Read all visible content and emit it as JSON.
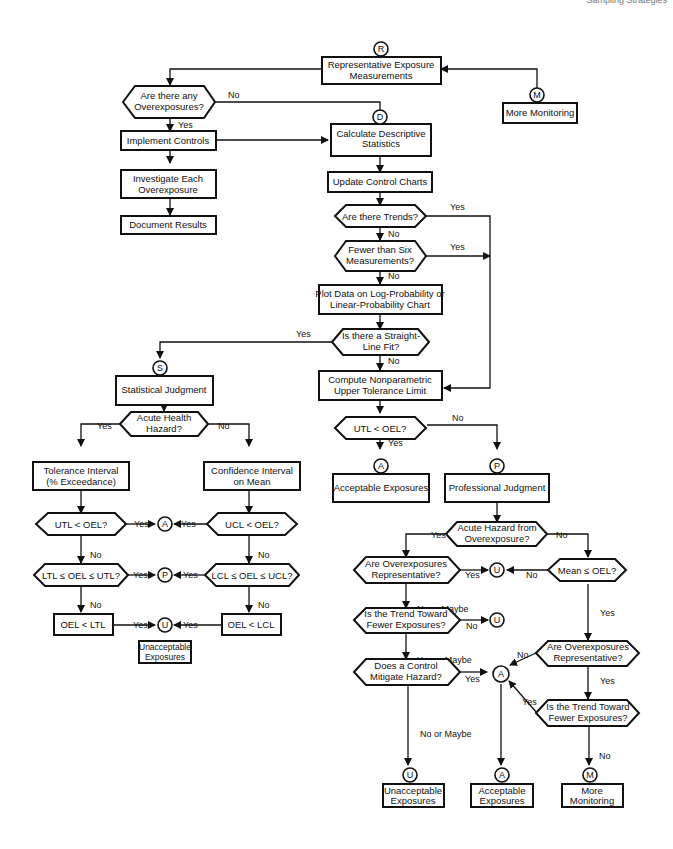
{
  "header": {
    "running_head": "Sampling Strategies"
  },
  "connectors": {
    "R": "R",
    "D": "D",
    "M": "M",
    "S": "S",
    "A": "A",
    "P": "P",
    "U": "U"
  },
  "nodes": {
    "rep_exposure": [
      "Representative Exposure",
      "Measurements"
    ],
    "more_monitoring_top": [
      "More Monitoring"
    ],
    "any_overexposures": [
      "Are there any",
      "Overexposures?"
    ],
    "implement_controls": [
      "Implement Controls"
    ],
    "investigate": [
      "Investigate Each",
      "Overexposure"
    ],
    "document": [
      "Document Results"
    ],
    "calc_desc": [
      "Calculate Descriptive",
      "Statistics"
    ],
    "update_charts": [
      "Update Control Charts"
    ],
    "trends": [
      "Are there Trends?"
    ],
    "fewer_six": [
      "Fewer than Six",
      "Measurements?"
    ],
    "plot_data": [
      "Plot Data on Log-Probability or",
      "Linear-Probability Chart"
    ],
    "straight_line": [
      "Is there a Straight-",
      "Line Fit?"
    ],
    "compute_utl": [
      "Compute Nonparametric",
      "Upper Tolerance Limit"
    ],
    "utl_oel_main": [
      "UTL < OEL?"
    ],
    "acceptable_main": [
      "Acceptable Exposures"
    ],
    "professional": [
      "Professional Judgment"
    ],
    "statistical": [
      "Statistical Judgment"
    ],
    "acute_health": [
      "Acute Health",
      "Hazard?"
    ],
    "tolerance_interval": [
      "Tolerance Interval",
      "(% Exceedance)"
    ],
    "confidence_interval": [
      "Confidence Interval",
      "on Mean"
    ],
    "utl_oel": [
      "UTL < OEL?"
    ],
    "ucl_oel": [
      "UCL < OEL?"
    ],
    "ltl_range": [
      "LTL ≤ OEL ≤ UTL?"
    ],
    "lcl_range": [
      "LCL ≤ OEL ≤ UCL?"
    ],
    "oel_ltl": [
      "OEL < LTL"
    ],
    "oel_lcl": [
      "OEL < LCL"
    ],
    "unacceptable_left": [
      "Unacceptable",
      "Exposures"
    ],
    "acute_hazard_over": [
      "Acute Hazard from",
      "Overexposure?"
    ],
    "over_rep_left": [
      "Are Overexposures",
      "Representative?"
    ],
    "mean_oel": [
      "Mean ≤ OEL?"
    ],
    "trend_fewer_left": [
      "Is the Trend Toward",
      "Fewer Exposures?"
    ],
    "control_mitigate": [
      "Does a Control",
      "Mitigate Hazard?"
    ],
    "over_rep_right": [
      "Are Overexposures",
      "Representative?"
    ],
    "trend_fewer_right": [
      "Is the Trend Toward",
      "Fewer Exposures?"
    ],
    "unacceptable_bottom": [
      "Unacceptable",
      "Exposures"
    ],
    "acceptable_bottom": [
      "Acceptable",
      "Exposures"
    ],
    "more_monitoring_bottom": [
      "More",
      "Monitoring"
    ]
  },
  "edge_labels": {
    "yes": "Yes",
    "no": "No",
    "no_or_maybe": "No or Maybe",
    "yes_or_maybe": "Yes or Maybe"
  }
}
